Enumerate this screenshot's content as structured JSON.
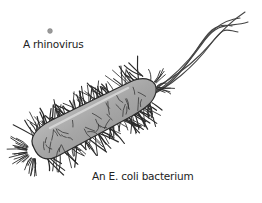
{
  "figure": {
    "subjects": [
      {
        "id": "rhinovirus",
        "label": "A rhinovirus",
        "color": "#9a9a9a"
      },
      {
        "id": "ecoli",
        "label": "An E. coli bacterium",
        "body_color": "#a8a8a8",
        "outline_color": "#2a2a2a",
        "pili_color": "#2a2a2a",
        "flagella_color": "#444444"
      }
    ]
  }
}
